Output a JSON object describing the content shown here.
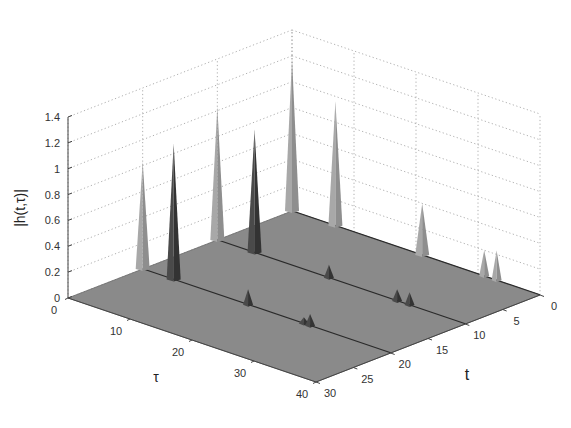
{
  "chart_data": {
    "type": "surface3d",
    "title": "",
    "xlabel": "τ",
    "ylabel": "t",
    "zlabel": "|h(t,τ)|",
    "x_ticks": [
      "0",
      "10",
      "20",
      "30",
      "40"
    ],
    "y_ticks": [
      "0",
      "5",
      "10",
      "15",
      "20",
      "25",
      "30"
    ],
    "z_ticks": [
      "0",
      "0.2",
      "0.4",
      "0.6",
      "0.8",
      "1",
      "1.2",
      "1.4"
    ],
    "xlim": [
      0,
      40
    ],
    "ylim": [
      0,
      30
    ],
    "zlim": [
      0,
      1.4
    ],
    "grid": true,
    "surface_color": "#8a8a8a",
    "ridge_lines_t": [
      0,
      10,
      20
    ],
    "peaks": [
      {
        "tau": 0,
        "t": 0,
        "value": 1.18,
        "shade": "light"
      },
      {
        "tau": 7,
        "t": 0,
        "value": 0.96,
        "shade": "light"
      },
      {
        "tau": 21,
        "t": 0,
        "value": 0.4,
        "shade": "light"
      },
      {
        "tau": 31,
        "t": 0,
        "value": 0.2,
        "shade": "light"
      },
      {
        "tau": 33,
        "t": 0,
        "value": 0.23,
        "shade": "light"
      },
      {
        "tau": 0,
        "t": 10,
        "value": 1.03,
        "shade": "light"
      },
      {
        "tau": 6,
        "t": 10,
        "value": 0.95,
        "shade": "dark"
      },
      {
        "tau": 18,
        "t": 10,
        "value": 0.1,
        "shade": "dark"
      },
      {
        "tau": 29,
        "t": 10,
        "value": 0.09,
        "shade": "dark"
      },
      {
        "tau": 31,
        "t": 10,
        "value": 0.1,
        "shade": "dark"
      },
      {
        "tau": 0,
        "t": 20,
        "value": 0.83,
        "shade": "light"
      },
      {
        "tau": 5,
        "t": 20,
        "value": 1.05,
        "shade": "dark"
      },
      {
        "tau": 17,
        "t": 20,
        "value": 0.12,
        "shade": "dark"
      },
      {
        "tau": 26,
        "t": 20,
        "value": 0.05,
        "shade": "dark"
      },
      {
        "tau": 27,
        "t": 20,
        "value": 0.09,
        "shade": "dark"
      }
    ]
  },
  "labels": {
    "zlabel": "|h(t,τ)|",
    "xlabel": "τ",
    "ylabel": "t",
    "caption": ""
  }
}
